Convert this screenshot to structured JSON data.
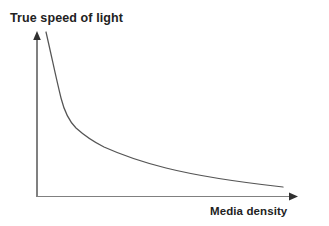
{
  "chart_data": {
    "type": "line",
    "title": "",
    "subtitle": "",
    "xlabel": "Media density",
    "ylabel": "True speed of light",
    "grid": false,
    "legend": false,
    "legend_position": "none",
    "axis_style": "arrow-axes",
    "tick_labels_x": [],
    "tick_labels_y": [],
    "xlim": [
      0,
      1
    ],
    "ylim": [
      0,
      1
    ],
    "series": [
      {
        "name": "True speed of light vs media density",
        "color": "#555555",
        "x": [
          0.035,
          0.06,
          0.08,
          0.098,
          0.112,
          0.128,
          0.146,
          0.168,
          0.2,
          0.242,
          0.3,
          0.37,
          0.45,
          0.53,
          0.62,
          0.72,
          0.83,
          0.945
        ],
        "y": [
          1.0,
          0.855,
          0.72,
          0.6,
          0.52,
          0.455,
          0.408,
          0.372,
          0.33,
          0.296,
          0.262,
          0.232,
          0.206,
          0.184,
          0.163,
          0.14,
          0.117,
          0.092
        ]
      }
    ],
    "pixel_geometry": {
      "origin": [
        37,
        196.5
      ],
      "y_axis_top": [
        37,
        33
      ],
      "x_axis_right": [
        297,
        196.5
      ],
      "curve_start": [
        46,
        32
      ],
      "curve_end": [
        283,
        187
      ],
      "curve_path": "M 46,32 C 52,58 56,78 61,98 C 65,114 70,122 76,128 C 86,137 94,142 104,147 C 124,156 142,162 166,168 C 198,176 238,182 283,187"
    }
  },
  "colors": {
    "background": "#ffffff",
    "axis": "#808080",
    "curve": "#555555",
    "text": "#222222"
  }
}
